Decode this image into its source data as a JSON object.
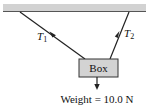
{
  "diagram": {
    "type": "free-body / tension diagram",
    "ceiling": {
      "label": "",
      "color": "#cfcfcf",
      "edge_color": "#555555"
    },
    "ropes": [
      {
        "name": "T1",
        "symbol": "T",
        "subscript": "1",
        "from": [
          20,
          12
        ],
        "to": [
          85,
          59
        ]
      },
      {
        "name": "T2",
        "symbol": "T",
        "subscript": "2",
        "from": [
          129,
          12
        ],
        "to": [
          110,
          59
        ]
      }
    ],
    "box": {
      "label": "Box",
      "fill": "#d3d3d3",
      "stroke": "#333333"
    },
    "weight": {
      "label": "Weight = 10.0 N",
      "direction": "down"
    }
  }
}
